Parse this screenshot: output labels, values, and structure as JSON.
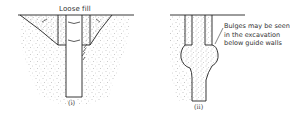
{
  "figure_i": {
    "label_loose_fill": "Loose fill",
    "caption": "(i)"
  },
  "figure_ii": {
    "note_lines": [
      "Bulges may be seen",
      "in the excavation",
      "below guide walls"
    ],
    "caption": "(ii)"
  },
  "colors": {
    "line": "#222222",
    "stipple": "#8a8a8a",
    "background": "#ffffff"
  }
}
